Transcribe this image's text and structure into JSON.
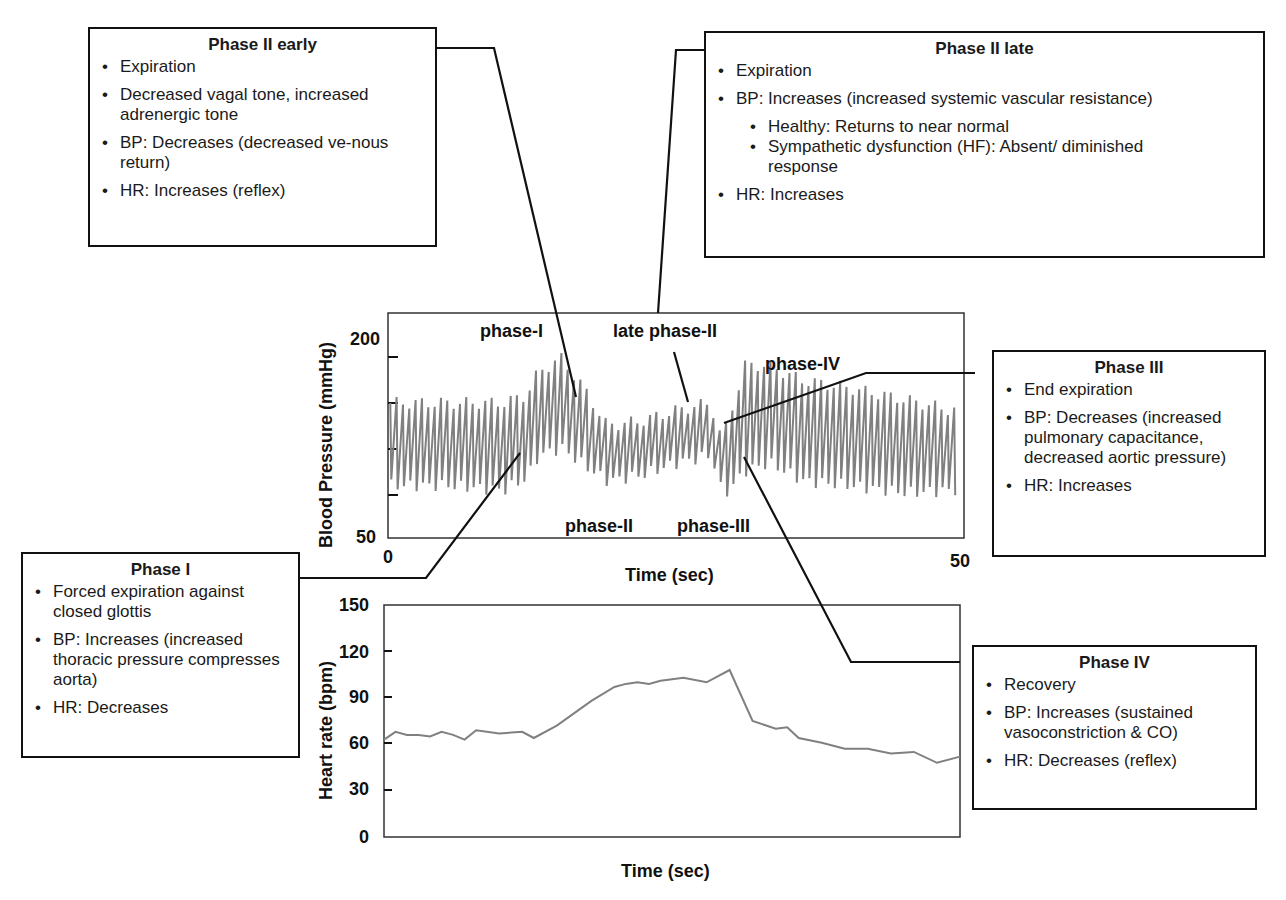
{
  "boxes": {
    "phase2early": {
      "title": "Phase II early",
      "items": [
        "Expiration",
        "Decreased vagal tone, increased adrenergic tone",
        "BP: Decreases (decreased ve-nous return)",
        "HR: Increases (reflex)"
      ]
    },
    "phase2late": {
      "title": "Phase II late",
      "items": [
        "Expiration",
        "BP: Increases (increased systemic vascular resistance)",
        "HR: Increases"
      ],
      "subitems": [
        "Healthy: Returns to near normal",
        "Sympathetic dysfunction (HF): Absent/ diminished response"
      ]
    },
    "phase3": {
      "title": "Phase III",
      "items": [
        "End expiration",
        "BP: Decreases (increased pulmonary capacitance, decreased aortic pressure)",
        "HR: Increases"
      ]
    },
    "phase1": {
      "title": "Phase I",
      "items": [
        "Forced expiration against closed glottis",
        "BP: Increases (increased thoracic pressure compresses aorta)",
        "HR: Decreases"
      ]
    },
    "phase4": {
      "title": "Phase IV",
      "items": [
        "Recovery",
        "BP: Increases (sustained vasoconstriction & CO)",
        "HR: Decreases (reflex)"
      ]
    }
  },
  "bp_chart": {
    "ylabel": "Blood Pressure (mmHg)",
    "xlabel": "Time (sec)",
    "y_top": "200",
    "y_bottom": "50",
    "x_left": "0",
    "x_right": "50",
    "annotations": {
      "phase1": "phase-I",
      "late_phase2": "late phase-II",
      "phase4": "phase-IV",
      "phase2": "phase-II",
      "phase3": "phase-III"
    }
  },
  "hr_chart": {
    "ylabel": "Heart rate (bpm)",
    "xlabel": "Time (sec)",
    "yticks": [
      "150",
      "120",
      "90",
      "60",
      "30",
      "0"
    ]
  },
  "colors": {
    "trace": "#808080",
    "line": "#111111"
  },
  "chart_data": [
    {
      "type": "line",
      "title": "Blood pressure during Valsalva maneuver",
      "xlabel": "Time (sec)",
      "ylabel": "Blood Pressure (mmHg)",
      "xlim": [
        0,
        50
      ],
      "ylim": [
        50,
        200
      ],
      "annotations": [
        "phase-I",
        "late phase-II",
        "phase-IV",
        "phase-II",
        "phase-III"
      ],
      "series": [
        {
          "name": "BP envelope (systolic peaks)",
          "x": [
            0,
            5,
            10,
            12,
            13,
            15,
            17,
            19,
            22,
            25,
            28,
            29,
            31,
            33,
            36,
            40,
            45,
            49
          ],
          "values": [
            140,
            140,
            140,
            145,
            160,
            170,
            150,
            125,
            128,
            135,
            140,
            115,
            165,
            165,
            155,
            150,
            142,
            135
          ]
        },
        {
          "name": "BP envelope (diastolic troughs)",
          "x": [
            0,
            5,
            10,
            12,
            13,
            15,
            17,
            19,
            22,
            25,
            28,
            29,
            31,
            33,
            36,
            40,
            45,
            49
          ],
          "values": [
            85,
            85,
            82,
            90,
            105,
            110,
            98,
            88,
            92,
            100,
            105,
            78,
            95,
            100,
            88,
            85,
            80,
            82
          ]
        }
      ]
    },
    {
      "type": "line",
      "title": "Heart rate during Valsalva maneuver",
      "xlabel": "Time (sec)",
      "ylabel": "Heart rate (bpm)",
      "ylim": [
        0,
        150
      ],
      "yticks": [
        0,
        30,
        60,
        90,
        120,
        150
      ],
      "series": [
        {
          "name": "Heart rate",
          "x": [
            0,
            1,
            2,
            3,
            4,
            5,
            6,
            7,
            8,
            10,
            12,
            13,
            15,
            18,
            20,
            21,
            22,
            23,
            24,
            26,
            28,
            30,
            32,
            34,
            35,
            36,
            38,
            40,
            42,
            44,
            46,
            48,
            50
          ],
          "values": [
            63,
            68,
            66,
            66,
            65,
            68,
            66,
            63,
            69,
            67,
            68,
            64,
            72,
            88,
            97,
            99,
            100,
            99,
            101,
            103,
            100,
            108,
            75,
            70,
            71,
            64,
            61,
            57,
            57,
            54,
            55,
            48,
            52
          ]
        }
      ]
    }
  ]
}
